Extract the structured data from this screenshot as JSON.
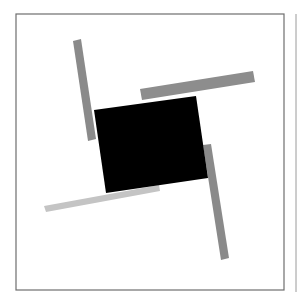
{
  "figure": {
    "width": 297,
    "height": 305,
    "background": "#ffffff",
    "frame": {
      "x": 16,
      "y": 14,
      "width": 268,
      "height": 276,
      "stroke": "#6e6e6e",
      "stroke_width": 1.2
    },
    "edge_line": {
      "x": 296,
      "y1": 14,
      "y2": 292,
      "stroke": "#9a9a9a"
    },
    "shapes": [
      {
        "name": "bar-top-left",
        "points": "73,41 81,39 96,139 88,141",
        "fill": "#8a8a8a"
      },
      {
        "name": "bar-top-right",
        "points": "140,89 253,71 255,82 142,100",
        "fill": "#8d8d8d"
      },
      {
        "name": "bar-bottom-right",
        "points": "203,145 211,144 229,258 221,260",
        "fill": "#8a8a8a"
      },
      {
        "name": "bar-bottom-left",
        "points": "44,206 159,185 160,191 46,212",
        "fill": "#c4c4c4"
      },
      {
        "name": "black-square",
        "points": "94,110 196,96 208,178 106,193",
        "fill": "#000000"
      }
    ]
  }
}
